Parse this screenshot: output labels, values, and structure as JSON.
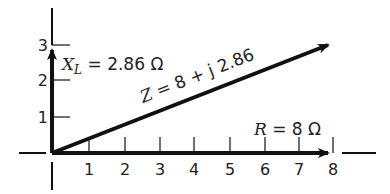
{
  "diagram": {
    "type": "impedance phasor diagram",
    "x_ticks": [
      "1",
      "2",
      "3",
      "4",
      "5",
      "6",
      "7",
      "8"
    ],
    "y_ticks": [
      "1",
      "2",
      "3"
    ],
    "labels": {
      "xl_symbol": "X",
      "xl_sub": "L",
      "xl_value": " = 2.86 Ω",
      "z_symbol": "Z",
      "z_value": " = 8 + j 2.86",
      "r_symbol": "R",
      "r_value": " =  8 Ω"
    },
    "vectors": [
      {
        "name": "X_L",
        "from": [
          0,
          0
        ],
        "to": [
          0,
          2.86
        ]
      },
      {
        "name": "Z",
        "from": [
          0,
          0
        ],
        "to": [
          8,
          2.86
        ]
      },
      {
        "name": "R",
        "from": [
          0,
          0
        ],
        "to": [
          8,
          0
        ]
      }
    ],
    "colors": {
      "ink": "#111111",
      "background": "#ffffff"
    }
  }
}
